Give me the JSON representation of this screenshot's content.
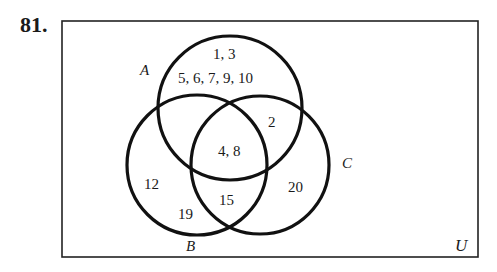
{
  "problem_number": "81.",
  "universe_label": "U",
  "sets": [
    {
      "name": "A",
      "label": "A"
    },
    {
      "name": "B",
      "label": "B"
    },
    {
      "name": "C",
      "label": "C"
    }
  ],
  "regions": {
    "A_only_top": "1, 3",
    "A_only_bottom": "5, 6, 7, 9, 10",
    "A_and_C_only": "2",
    "A_and_B_and_C": "4, 8",
    "B_only_1": "12",
    "B_only_2": "19",
    "B_and_C_only": "15",
    "C_only": "20"
  }
}
